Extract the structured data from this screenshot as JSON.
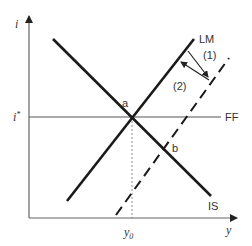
{
  "diagram": {
    "type": "IS-LM-FF economic diagram",
    "axes": {
      "y_axis_label": "i",
      "x_axis_label": "y"
    },
    "curves": {
      "is_label": "IS",
      "lm_label": "LM",
      "ff_label": "FF",
      "shifted_lm_style": "dashed"
    },
    "levels": {
      "interest_label": "i",
      "interest_superscript": "*",
      "output_label": "y",
      "output_subscript": "0"
    },
    "points": {
      "a": "a",
      "b": "b"
    },
    "arrows": {
      "arrow1_label": "(1)",
      "arrow2_label": "(2)"
    },
    "colors": {
      "line": "#1a1a1a",
      "axis": "#555555",
      "text": "#333333"
    }
  }
}
